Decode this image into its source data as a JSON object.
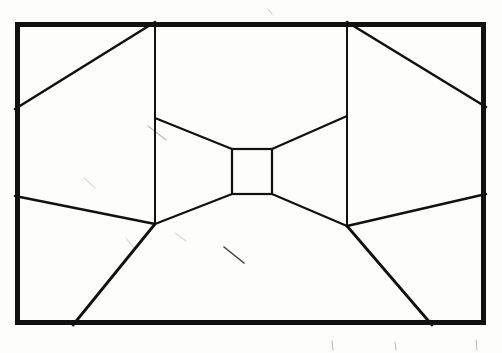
{
  "meta": {
    "domain": "Diagram",
    "width": 502,
    "height": 353,
    "background_color": "#fdfdfb",
    "ink_color": "#111111"
  },
  "figure": {
    "type": "line_drawing",
    "style": "hand_drawn_pen_on_paper",
    "frame": {
      "name": "outer-border-rectangle",
      "left": 15,
      "top": 22,
      "right": 486,
      "bottom": 325,
      "stroke_width": 5,
      "color": "#111111"
    },
    "center_rect": {
      "name": "central-rectangle",
      "left": 232,
      "top": 149,
      "right": 272,
      "bottom": 194,
      "stroke_width": 2.2,
      "color": "#111111"
    },
    "vertical_lines": [
      {
        "name": "left-vertical-line",
        "x": 155,
        "y_top": 22,
        "y_bottom": 224,
        "stroke_width": 2.0
      },
      {
        "name": "right-vertical-line",
        "x": 347,
        "y_top": 22,
        "y_bottom": 226,
        "stroke_width": 2.0
      }
    ],
    "lines": [
      {
        "name": "upper-left-diagonal-to-frame",
        "x1": 155,
        "y1": 22,
        "x2": 15,
        "y2": 109,
        "stroke_width": 2.6
      },
      {
        "name": "upper-right-diagonal-to-frame",
        "x1": 347,
        "y1": 22,
        "x2": 486,
        "y2": 107,
        "stroke_width": 2.6
      },
      {
        "name": "left-vanishing-ray-upper",
        "x1": 155,
        "y1": 118,
        "x2": 232,
        "y2": 149,
        "stroke_width": 2.2
      },
      {
        "name": "right-vanishing-ray-upper",
        "x1": 347,
        "y1": 116,
        "x2": 272,
        "y2": 149,
        "stroke_width": 2.2
      },
      {
        "name": "left-vanishing-ray-lower",
        "x1": 155,
        "y1": 224,
        "x2": 232,
        "y2": 194,
        "stroke_width": 2.2
      },
      {
        "name": "right-vanishing-ray-lower",
        "x1": 347,
        "y1": 226,
        "x2": 272,
        "y2": 194,
        "stroke_width": 2.2
      },
      {
        "name": "left-midline-to-frame",
        "x1": 15,
        "y1": 196,
        "x2": 155,
        "y2": 224,
        "stroke_width": 2.4
      },
      {
        "name": "right-midline-to-frame",
        "x1": 486,
        "y1": 194,
        "x2": 347,
        "y2": 226,
        "stroke_width": 2.4
      },
      {
        "name": "lower-left-diagonal-to-bottom",
        "x1": 155,
        "y1": 224,
        "x2": 73,
        "y2": 325,
        "stroke_width": 2.8
      },
      {
        "name": "lower-right-diagonal-to-bottom",
        "x1": 347,
        "y1": 226,
        "x2": 432,
        "y2": 325,
        "stroke_width": 2.8
      }
    ],
    "smudges": [
      {
        "name": "smudge-upper-left-center",
        "x1": 148,
        "y1": 126,
        "x2": 166,
        "y2": 140,
        "opacity": 0.3,
        "width": 1.1
      },
      {
        "name": "smudge-left-mid",
        "x1": 84,
        "y1": 178,
        "x2": 95,
        "y2": 188,
        "opacity": 0.22,
        "width": 1.0
      },
      {
        "name": "smudge-center-lower",
        "x1": 224,
        "y1": 247,
        "x2": 244,
        "y2": 263,
        "opacity": 0.8,
        "width": 1.6
      },
      {
        "name": "smudge-below-center",
        "x1": 175,
        "y1": 233,
        "x2": 186,
        "y2": 241,
        "opacity": 0.22,
        "width": 1.0
      },
      {
        "name": "smudge-right-lower",
        "x1": 126,
        "y1": 238,
        "x2": 134,
        "y2": 248,
        "opacity": 0.2,
        "width": 1.0
      },
      {
        "name": "smudge-top-dot",
        "x1": 268,
        "y1": 9,
        "x2": 272,
        "y2": 14,
        "opacity": 0.25,
        "width": 1.0
      },
      {
        "name": "smudge-bottom-tick-a",
        "x1": 332,
        "y1": 341,
        "x2": 333,
        "y2": 350,
        "opacity": 0.3,
        "width": 1.0
      },
      {
        "name": "smudge-bottom-tick-b",
        "x1": 395,
        "y1": 342,
        "x2": 396,
        "y2": 350,
        "opacity": 0.3,
        "width": 1.0
      },
      {
        "name": "smudge-bottom-tick-c",
        "x1": 476,
        "y1": 340,
        "x2": 477,
        "y2": 350,
        "opacity": 0.28,
        "width": 1.0
      }
    ]
  }
}
